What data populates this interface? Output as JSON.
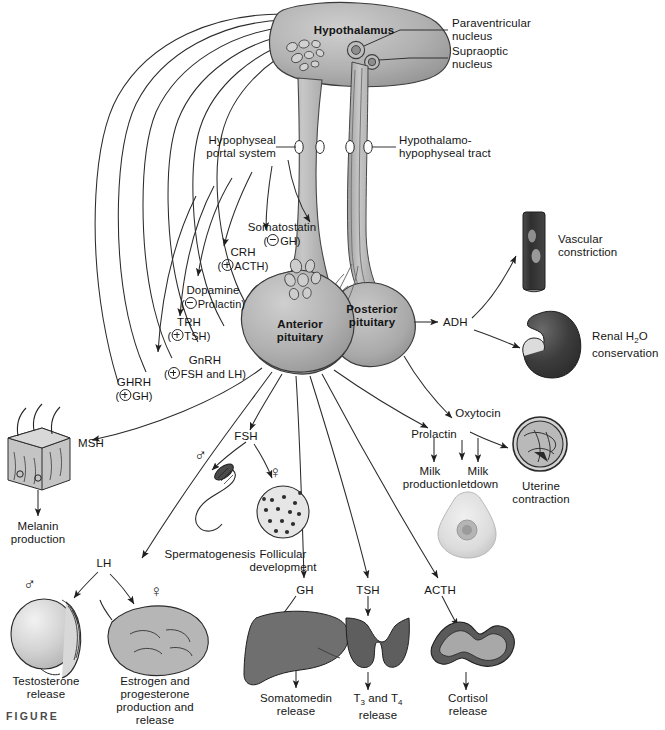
{
  "figure": {
    "caption_tag": "FIGURE"
  },
  "anatomy": {
    "hypothalamus": "Hypothalamus",
    "paraventricular_nucleus": "Paraventricular\nnucleus",
    "paraventricular_nucleus_l1": "Paraventricular",
    "paraventricular_nucleus_l2": "nucleus",
    "supraoptic_nucleus_l1": "Supraoptic",
    "supraoptic_nucleus_l2": "nucleus",
    "hypophyseal_portal_l1": "Hypophyseal",
    "hypophyseal_portal_l2": "portal system",
    "hypothalamo_tract_l1": "Hypothalamo-",
    "hypothalamo_tract_l2": "hypophyseal tract",
    "anterior_pituitary_l1": "Anterior",
    "anterior_pituitary_l2": "pituitary",
    "posterior_pituitary_l1": "Posterior",
    "posterior_pituitary_l2": "pituitary"
  },
  "releasing_hormones": [
    {
      "name": "Somatostatin",
      "effect_sign": "minus",
      "effect_target": "GH"
    },
    {
      "name": "CRH",
      "effect_sign": "plus",
      "effect_target": "ACTH"
    },
    {
      "name": "Dopamine",
      "effect_sign": "minus",
      "effect_target": "Prolactin"
    },
    {
      "name": "TRH",
      "effect_sign": "plus",
      "effect_target": "TSH"
    },
    {
      "name": "GnRH",
      "effect_sign": "plus",
      "effect_target": "FSH and LH"
    },
    {
      "name": "GHRH",
      "effect_sign": "plus",
      "effect_target": "GH"
    }
  ],
  "posterior_hormones": {
    "adh": "ADH",
    "oxytocin": "Oxytocin"
  },
  "anterior_hormones": {
    "msh": "MSH",
    "fsh": "FSH",
    "lh": "LH",
    "prolactin": "Prolactin",
    "gh": "GH",
    "tsh": "TSH",
    "acth": "ACTH"
  },
  "targets": [
    {
      "id": "vascular",
      "l1": "Vascular",
      "l2": "constriction"
    },
    {
      "id": "renal",
      "l1": "Renal H",
      "l1_sub": "2",
      "l1_tail": "O",
      "l2": "conservation"
    },
    {
      "id": "uterine",
      "l1": "Uterine",
      "l2": "contraction"
    },
    {
      "id": "milk-letdown",
      "l1": "Milk",
      "l2": "letdown"
    },
    {
      "id": "milk-production",
      "l1": "Milk",
      "l2": "production"
    },
    {
      "id": "melanin",
      "l1": "Melanin",
      "l2": "production"
    },
    {
      "id": "spermatogenesis",
      "l1": "Spermatogenesis",
      "l2": ""
    },
    {
      "id": "follicular",
      "l1": "Follicular",
      "l2": "development"
    },
    {
      "id": "testosterone",
      "l1": "Testosterone",
      "l2": "release"
    },
    {
      "id": "estrogen",
      "l1": "Estrogen and",
      "l2": "progesterone",
      "l3": "production and",
      "l4": "release"
    },
    {
      "id": "somatomedin",
      "l1": "Somatomedin",
      "l2": "release"
    },
    {
      "id": "t3t4",
      "l1": "T",
      "l1_sub": "3",
      "l1_mid": " and T",
      "l1_sub2": "4",
      "l2": "release"
    },
    {
      "id": "cortisol",
      "l1": "Cortisol",
      "l2": "release"
    }
  ],
  "symbols": {
    "male": "♂",
    "female": "♀"
  },
  "colors": {
    "gland_gray": "#ababab",
    "gland_gray_light": "#c6c6c6",
    "dark_organ": "#3b3b3b",
    "mid_organ": "#7d7d7d",
    "stroke": "#2b2b2b",
    "background": "#ffffff"
  }
}
